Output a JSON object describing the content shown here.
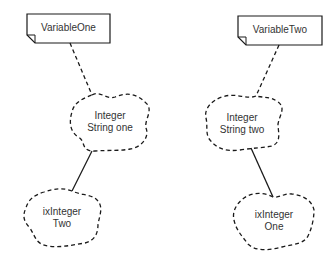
{
  "diagram": {
    "left": {
      "note": {
        "label": "VariableOne"
      },
      "upper_cloud": {
        "line1": "Integer",
        "line2": "String one"
      },
      "lower_cloud": {
        "line1": "ixInteger",
        "line2": "Two"
      }
    },
    "right": {
      "note": {
        "label": "VariableTwo"
      },
      "upper_cloud": {
        "line1": "Integer",
        "line2": "String two"
      },
      "lower_cloud": {
        "line1": "ixInteger",
        "line2": "One"
      }
    }
  },
  "colors": {
    "stroke": "#1a1a1a",
    "text": "#333333",
    "background": "#ffffff"
  }
}
